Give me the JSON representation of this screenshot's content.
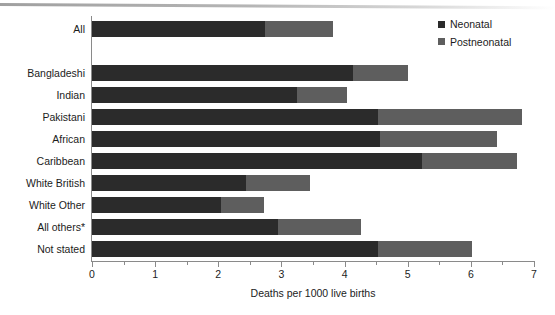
{
  "chart_data": {
    "type": "bar",
    "orientation": "horizontal",
    "stacked": true,
    "title": "",
    "xlabel": "Deaths per 1000 live births",
    "ylabel": "",
    "xlim": [
      0,
      7
    ],
    "grid": false,
    "legend_position": "top-right",
    "categories": [
      "All",
      "Bangladeshi",
      "Indian",
      "Pakistani",
      "African",
      "Caribbean",
      "White British",
      "White Other",
      "All others*",
      "Not stated"
    ],
    "series": [
      {
        "name": "Neonatal",
        "color": "#2b2b2b",
        "values": [
          2.74,
          4.14,
          3.25,
          4.53,
          4.56,
          5.23,
          2.44,
          2.04,
          2.95,
          4.53
        ]
      },
      {
        "name": "Postneonatal",
        "color": "#5e5e5e",
        "values": [
          1.08,
          0.87,
          0.79,
          2.28,
          1.86,
          1.5,
          1.01,
          0.69,
          1.31,
          1.49
        ]
      }
    ],
    "totals": [
      3.82,
      5.01,
      4.04,
      6.81,
      6.42,
      6.73,
      3.45,
      2.73,
      4.26,
      6.02
    ],
    "xticks_major": [
      0,
      1,
      2,
      3,
      4,
      5,
      6,
      7
    ],
    "xtick_labels": [
      "0",
      "1",
      "2",
      "3",
      "4",
      "5",
      "6",
      "7"
    ],
    "xticks_minor": [
      0.5,
      1.5,
      2.5,
      3.5,
      4.5,
      5.5,
      6.5
    ]
  },
  "legend": {
    "items": [
      {
        "label": "Neonatal",
        "color": "#2b2b2b"
      },
      {
        "label": "Postneonatal",
        "color": "#5e5e5e"
      }
    ]
  },
  "axis": {
    "x_title": "Deaths per 1000 live births"
  }
}
